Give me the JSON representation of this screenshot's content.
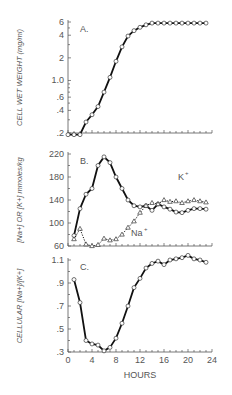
{
  "chart_data": [
    {
      "type": "line",
      "panel": "A.",
      "ylabel": "CELL WET WEIGHT (mg/ml)",
      "yscale": "log",
      "ylim": [
        0.2,
        6
      ],
      "yticks": [
        "6",
        "4",
        "2",
        "1.0",
        ".6",
        ".4",
        ".2"
      ],
      "ytick_values": [
        6,
        4,
        2,
        1.0,
        0.6,
        0.4,
        0.2
      ],
      "xlim": [
        0,
        24
      ],
      "series": [
        {
          "name": "cell wet weight",
          "marker": "circle",
          "x": [
            0,
            1,
            2,
            3,
            4,
            5,
            6,
            7,
            8,
            9,
            10,
            11,
            12,
            13,
            14,
            15,
            16,
            17,
            18,
            19,
            20,
            21,
            22,
            23
          ],
          "values": [
            0.19,
            0.19,
            0.19,
            0.28,
            0.35,
            0.45,
            0.7,
            1.1,
            1.8,
            2.8,
            3.9,
            4.6,
            5.1,
            5.5,
            5.8,
            5.8,
            5.8,
            5.8,
            5.8,
            5.8,
            5.8,
            5.8,
            5.8,
            5.8
          ]
        }
      ]
    },
    {
      "type": "line",
      "panel": "B.",
      "ylabel": "[Na+] OR [K+] mmoles/kg",
      "ylim": [
        60,
        220
      ],
      "yticks": [
        "220",
        "180",
        "140",
        "100",
        "60"
      ],
      "ytick_values": [
        220,
        180,
        140,
        100,
        60
      ],
      "xlim": [
        0,
        24
      ],
      "annotations": [
        "K+",
        "Na+"
      ],
      "series": [
        {
          "name": "K+",
          "marker": "circle",
          "x": [
            1,
            2,
            3,
            4,
            5,
            6,
            7,
            8,
            9,
            10,
            11,
            12,
            13,
            14,
            15,
            16,
            17,
            18,
            19,
            20,
            21,
            22,
            23
          ],
          "values": [
            78,
            125,
            150,
            160,
            200,
            215,
            205,
            180,
            160,
            140,
            130,
            128,
            130,
            122,
            133,
            128,
            124,
            119,
            118,
            122,
            125,
            125,
            124
          ]
        },
        {
          "name": "Na+",
          "marker": "triangle",
          "style": "dotted",
          "x": [
            1,
            2,
            3,
            4,
            5,
            6,
            7,
            8,
            9,
            10,
            11,
            12,
            13,
            14,
            15,
            16,
            17,
            18,
            19,
            20,
            21,
            22,
            23
          ],
          "values": [
            72,
            90,
            63,
            60,
            62,
            73,
            70,
            72,
            80,
            92,
            103,
            118,
            130,
            135,
            133,
            140,
            137,
            138,
            135,
            138,
            140,
            138,
            136
          ]
        }
      ]
    },
    {
      "type": "line",
      "panel": "C.",
      "ylabel": "CELLULAR [Na+]/[K+]",
      "ylim": [
        0.3,
        1.1
      ],
      "yticks": [
        "1.1",
        ".9",
        ".7",
        ".5",
        ".3"
      ],
      "ytick_values": [
        1.1,
        0.9,
        0.7,
        0.5,
        0.3
      ],
      "xlabel": "HOURS",
      "xticks": [
        "0",
        "4",
        "8",
        "12",
        "16",
        "20",
        "24"
      ],
      "xtick_values": [
        0,
        4,
        8,
        12,
        16,
        20,
        24
      ],
      "xlim": [
        0,
        24
      ],
      "series": [
        {
          "name": "Na/K ratio",
          "marker": "circle",
          "x": [
            1,
            2,
            3,
            4,
            5,
            6,
            7,
            8,
            9,
            10,
            11,
            12,
            13,
            14,
            15,
            16,
            17,
            18,
            19,
            20,
            21,
            22,
            23
          ],
          "values": [
            0.93,
            0.73,
            0.4,
            0.37,
            0.36,
            0.31,
            0.34,
            0.42,
            0.55,
            0.7,
            0.86,
            0.94,
            1.03,
            1.07,
            1.09,
            1.06,
            1.1,
            1.11,
            1.12,
            1.14,
            1.11,
            1.1,
            1.08
          ]
        }
      ]
    }
  ]
}
